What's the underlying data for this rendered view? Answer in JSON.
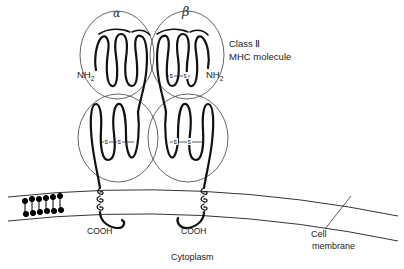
{
  "diagram": {
    "chain_labels": {
      "alpha": "α",
      "beta": "β"
    },
    "title": {
      "line1": "Class Ⅱ",
      "line2": "MHC molecule"
    },
    "terminals": {
      "nh2_left": "NH",
      "nh2_right": "NH",
      "nh2_subscript": "2",
      "cooh_left": "COOH",
      "cooh_right": "COOH"
    },
    "disulfide_label": "s",
    "regions": {
      "cytoplasm": "Cytoplasm"
    },
    "membrane_label": {
      "line1": "Cell",
      "line2": "membrane"
    },
    "colors": {
      "stroke": "#111111",
      "outline": "#555555",
      "background": "#ffffff"
    }
  }
}
